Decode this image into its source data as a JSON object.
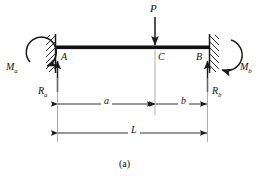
{
  "figure": {
    "caption": "(a)",
    "type": "fixed-fixed-beam-free-body-diagram",
    "background": "#ffffff",
    "line_color": "#1a1a1a",
    "beam_color": "#111111"
  },
  "labels": {
    "load": "P",
    "point_a": "A",
    "point_c": "C",
    "point_b": "B",
    "moment_a": "M",
    "moment_a_sub": "a",
    "moment_b": "M",
    "moment_b_sub": "b",
    "reaction_a": "R",
    "reaction_a_sub": "a",
    "reaction_b": "R",
    "reaction_b_sub": "b",
    "dim_a": "a",
    "dim_b": "b",
    "dim_l": "L"
  },
  "geometry": {
    "beam_left_x": 55,
    "beam_right_x": 210,
    "beam_y": 47,
    "beam_thickness": 4,
    "load_point_x": 155,
    "dim_ab_y": 104,
    "dim_l_y": 133,
    "wall_top_y": 35,
    "wall_bottom_y": 72
  }
}
